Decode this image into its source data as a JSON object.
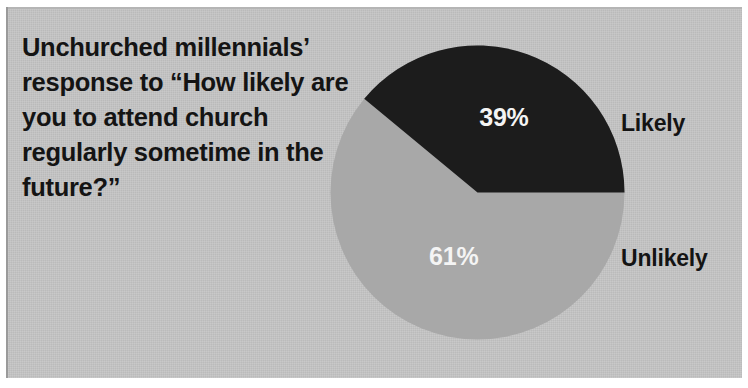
{
  "title": "Unchurched millennials’ response to “How likely are you to attend church regularly sometime in the future?”",
  "legend": {
    "likely": "Likely",
    "unlikely": "Unlikely"
  },
  "values": {
    "likely": "39%",
    "unlikely": "61%"
  },
  "colors": {
    "likely_slice": "#1c1c1c",
    "unlikely_slice": "#a8a8a8",
    "background": "#c6c6c6",
    "title_text": "#141414",
    "value_text": "#f4f4f4"
  },
  "chart_data": {
    "type": "pie",
    "title": "Unchurched millennials’ response to “How likely are you to attend church regularly sometime in the future?”",
    "categories": [
      "Likely",
      "Unlikely"
    ],
    "values": [
      39,
      61
    ],
    "value_labels": [
      "39%",
      "61%"
    ],
    "units": "percent",
    "slice_colors": [
      "#1c1c1c",
      "#a8a8a8"
    ],
    "legend": [
      "Likely",
      "Unlikely"
    ],
    "legend_position": "right",
    "start_angle_deg": 0,
    "direction": "counterclockwise",
    "grid": false,
    "xlabel": "",
    "ylabel": ""
  }
}
